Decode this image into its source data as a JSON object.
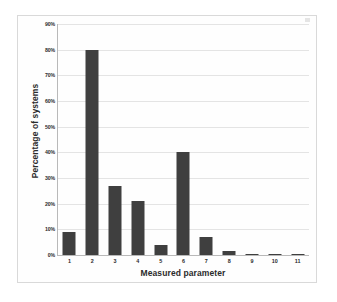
{
  "chart_data": {
    "type": "bar",
    "title": "",
    "xlabel": "Measured parameter",
    "ylabel": "Percentage of systems",
    "categories": [
      "1",
      "2",
      "3",
      "4",
      "5",
      "6",
      "7",
      "8",
      "9",
      "10",
      "11"
    ],
    "values": [
      9,
      80,
      27,
      21,
      4,
      40,
      7,
      1.5,
      0.3,
      0.5,
      0.3
    ],
    "ylim": [
      0,
      90
    ],
    "ytick_labels": [
      "90%",
      "80%",
      "70%",
      "60%",
      "50%",
      "40%",
      "30%",
      "20%",
      "10%",
      "0%"
    ],
    "ytick_values": [
      90,
      80,
      70,
      60,
      50,
      40,
      30,
      20,
      10,
      0
    ],
    "grid": true,
    "legend": false,
    "series": [
      {
        "name": "Percentage of systems",
        "values": [
          9,
          80,
          27,
          21,
          4,
          40,
          7,
          1.5,
          0.3,
          0.5,
          0.3
        ]
      }
    ],
    "colors": {
      "bar": "#3f3f3f",
      "gridline": "#e4e4e4",
      "axis": "#b9b9b9",
      "background": "#ffffff",
      "text": "#2b2b2b"
    }
  }
}
